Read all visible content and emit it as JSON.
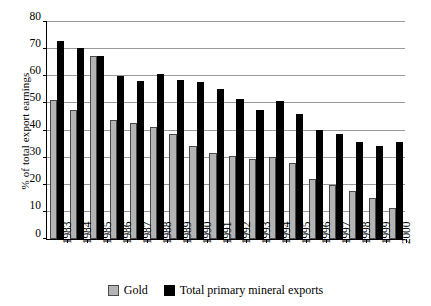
{
  "chart_data": {
    "type": "bar",
    "title": "",
    "subtitle": "",
    "xlabel": "",
    "ylabel": "% of total export earnings",
    "ylim": [
      0,
      80
    ],
    "ytick_step": 10,
    "yticks": [
      0,
      10,
      20,
      30,
      40,
      50,
      60,
      70,
      80
    ],
    "grid": "horizontal",
    "legend_position": "bottom-center",
    "categories": [
      "1983",
      "1984",
      "1985",
      "1986",
      "1987",
      "1988",
      "1989",
      "1990",
      "1991",
      "1992",
      "1993",
      "1994",
      "1995",
      "1996",
      "1997",
      "1998",
      "1999",
      "2000"
    ],
    "series": [
      {
        "name": "Gold",
        "color": "#b4b4b4",
        "values": [
          51,
          47.5,
          67,
          43.5,
          42.5,
          41,
          38.5,
          34,
          31.5,
          30.5,
          29.5,
          30,
          28,
          22,
          20,
          17.5,
          15,
          11.5
        ]
      },
      {
        "name": "Total primary mineral exports",
        "color": "#000000",
        "values": [
          72.5,
          70,
          67,
          60,
          58,
          60.5,
          58.5,
          57.5,
          55,
          51.5,
          47.5,
          50.5,
          46,
          40,
          38.5,
          35.5,
          34,
          35.5
        ]
      }
    ]
  },
  "axis": {
    "y_title": "% of total export earnings",
    "y_tick_labels": [
      "0",
      "10",
      "20",
      "30",
      "40",
      "50",
      "60",
      "70",
      "80"
    ],
    "x_tick_labels": [
      "1983",
      "1984",
      "1985",
      "1986",
      "1987",
      "1988",
      "1989",
      "1990",
      "1991",
      "1992",
      "1993",
      "1994",
      "1995",
      "1996",
      "1997",
      "1998",
      "1999",
      "2000"
    ]
  },
  "legend": {
    "items": [
      {
        "label": "Gold",
        "color": "#b4b4b4"
      },
      {
        "label": "Total primary mineral exports",
        "color": "#000000"
      }
    ]
  }
}
